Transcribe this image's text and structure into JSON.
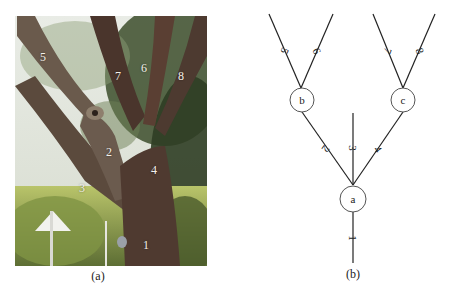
{
  "figure": {
    "panel_a": {
      "caption": "(a)",
      "description": "photograph of a branching tree trunk",
      "branch_labels": [
        "1",
        "2",
        "3",
        "4",
        "5",
        "6",
        "7",
        "8"
      ]
    },
    "panel_b": {
      "caption": "(b)",
      "nodes": [
        {
          "id": "a",
          "label": "a"
        },
        {
          "id": "b",
          "label": "b"
        },
        {
          "id": "c",
          "label": "c"
        }
      ],
      "edges": [
        {
          "label": "1",
          "from": "root",
          "to": "a"
        },
        {
          "label": "2",
          "from": "a",
          "to": "b"
        },
        {
          "label": "3",
          "from": "a",
          "to": "leaf"
        },
        {
          "label": "4",
          "from": "a",
          "to": "c"
        },
        {
          "label": "5",
          "from": "b",
          "to": "leaf"
        },
        {
          "label": "6",
          "from": "b",
          "to": "leaf"
        },
        {
          "label": "7",
          "from": "c",
          "to": "leaf"
        },
        {
          "label": "8",
          "from": "c",
          "to": "leaf"
        }
      ]
    }
  }
}
